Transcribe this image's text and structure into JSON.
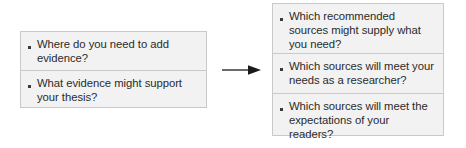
{
  "diagram": {
    "type": "flow-diagram",
    "background_color": "#ffffff",
    "box_fill_color": "#f2f2f2",
    "box_border_color": "#c9c9c9",
    "text_color": "#2b2b2b",
    "bullet_glyph": "square-bullet",
    "arrow": {
      "icon": "right-arrow-icon",
      "direction": "right",
      "color": "#1a1a1a"
    },
    "left_box": {
      "items": [
        {
          "text": "Where do you need to add evidence?"
        },
        {
          "text": "What evidence might support your thesis?"
        }
      ]
    },
    "right_box": {
      "items": [
        {
          "text": "Which recommended sources might supply what you need?"
        },
        {
          "text": "Which sources will meet your needs as a researcher?"
        },
        {
          "text": "Which sources will meet the expectations of your readers?"
        }
      ]
    }
  }
}
